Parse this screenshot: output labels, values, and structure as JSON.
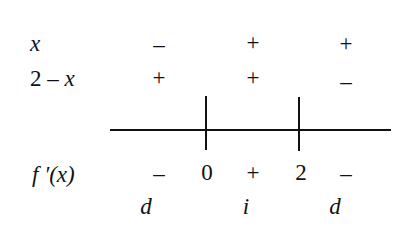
{
  "sign_chart": {
    "rows": [
      {
        "label": "x",
        "signs": [
          "–",
          "+",
          "+"
        ]
      },
      {
        "label_prefix": "2 – ",
        "label_var": "x",
        "signs": [
          "+",
          "+",
          "–"
        ]
      }
    ],
    "derivative_row": {
      "label": "f ′(x)",
      "signs": [
        "–",
        "+",
        "–"
      ],
      "critical_points": [
        "0",
        "2"
      ]
    },
    "behavior_row": {
      "values": [
        "d",
        "i",
        "d"
      ]
    }
  }
}
